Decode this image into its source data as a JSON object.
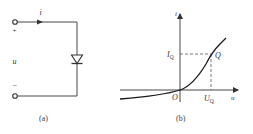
{
  "panels": {
    "a": {
      "caption": "(a)",
      "current_label": "i",
      "voltage_label": "u",
      "plus_sign": "+",
      "minus_sign": "−",
      "component": "diode"
    },
    "b": {
      "caption": "(b)",
      "y_axis_label": "i",
      "x_axis_label": "u",
      "origin_label": "O",
      "iq_label": "I",
      "iq_sub": "Q",
      "uq_label": "U",
      "uq_sub": "Q",
      "point_label": "Q"
    }
  },
  "colors": {
    "line": "#333333",
    "curve": "#1a1a1a",
    "dashed": "#555555",
    "background": "#ffffff"
  }
}
